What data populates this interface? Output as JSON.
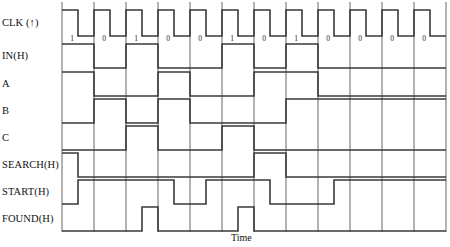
{
  "diagram": {
    "title_axis": "Time",
    "cell_count": 12,
    "plot": {
      "x0": 62,
      "x1": 446,
      "cell_width": 32
    },
    "colors": {
      "signal": "#3a3a3a",
      "grid": "#555555",
      "background": "#ffffff",
      "text": "#111111"
    },
    "signals": [
      {
        "name": "clk",
        "label": "CLK (↑)",
        "row_top": 10,
        "row_height": 26,
        "type": "clock",
        "description": "pulse high during first half of every cell",
        "values": [
          1,
          1,
          1,
          1,
          1,
          1,
          1,
          1,
          1,
          1,
          1,
          1
        ]
      },
      {
        "name": "in",
        "label": "IN(H)",
        "row_top": 44,
        "row_height": 24,
        "type": "data",
        "bit_labels": [
          "1",
          "0",
          "1",
          "0",
          "0",
          "1",
          "0",
          "1",
          "0",
          "0",
          "0",
          "0"
        ],
        "values": [
          1,
          0,
          1,
          0,
          0,
          1,
          0,
          1,
          0,
          0,
          0,
          0
        ]
      },
      {
        "name": "a",
        "label": "A",
        "row_top": 72,
        "row_height": 24,
        "type": "data",
        "values": [
          1,
          0,
          0,
          1,
          0,
          0,
          1,
          1,
          0,
          0,
          0,
          0
        ]
      },
      {
        "name": "b",
        "label": "B",
        "row_top": 99,
        "row_height": 24,
        "type": "data",
        "values": [
          0,
          1,
          0,
          1,
          0,
          0,
          0,
          1,
          1,
          1,
          1,
          1
        ]
      },
      {
        "name": "c",
        "label": "C",
        "row_top": 126,
        "row_height": 24,
        "type": "data",
        "values": [
          0,
          0,
          1,
          0,
          0,
          1,
          0,
          0,
          0,
          0,
          0,
          0
        ]
      },
      {
        "name": "search",
        "label": "SEARCH(H)",
        "row_top": 153,
        "row_height": 24,
        "type": "half-cell",
        "half_values": [
          1,
          0,
          0,
          0,
          0,
          0,
          0,
          0,
          0,
          0,
          0,
          0,
          1,
          1,
          0,
          0,
          0,
          0,
          0,
          0,
          0,
          0,
          0,
          0
        ]
      },
      {
        "name": "start",
        "label": "START(H)",
        "row_top": 180,
        "row_height": 24,
        "type": "half-cell",
        "half_values": [
          0,
          1,
          1,
          1,
          1,
          1,
          1,
          0,
          0,
          1,
          1,
          1,
          1,
          0,
          0,
          0,
          0,
          1,
          1,
          1,
          1,
          1,
          1,
          1
        ]
      },
      {
        "name": "found",
        "label": "FOUND(H)",
        "row_top": 207,
        "row_height": 24,
        "type": "half-cell",
        "half_values": [
          0,
          0,
          0,
          0,
          0,
          1,
          0,
          0,
          0,
          0,
          0,
          1,
          0,
          0,
          0,
          0,
          0,
          0,
          0,
          0,
          0,
          0,
          0,
          0
        ]
      }
    ]
  }
}
